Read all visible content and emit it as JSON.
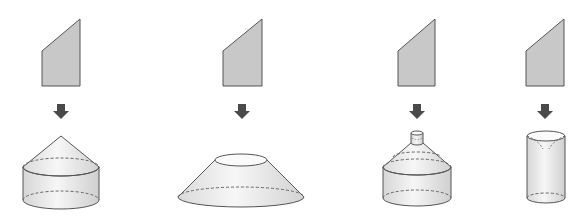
{
  "colors": {
    "shape_fill": "#c8c8c8",
    "shape_stroke": "#555555",
    "arrow": "#4a4a4a",
    "solid_fill_light": "#f4f4f4",
    "solid_fill_dark": "#d4d4d4",
    "dashed": "#666666"
  },
  "figures": [
    {
      "id": "1",
      "plane_shape": "right trapezoid (slanted top)",
      "arrow": "down-arrow",
      "solid": "cone on top of cylinder"
    },
    {
      "id": "2",
      "plane_shape": "right trapezoid (slanted top)",
      "arrow": "down-arrow",
      "solid": "frustum (truncated cone)"
    },
    {
      "id": "3",
      "plane_shape": "right trapezoid (slanted top)",
      "arrow": "down-arrow",
      "solid": "small cylinder on cone on cylinder"
    },
    {
      "id": "4",
      "plane_shape": "right trapezoid (slanted top)",
      "arrow": "down-arrow",
      "solid": "cylinder with conical hollow"
    }
  ]
}
